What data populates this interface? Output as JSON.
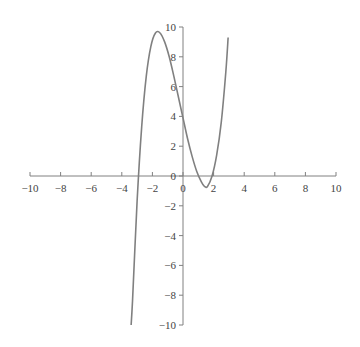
{
  "chart_data": {
    "type": "line",
    "title": "",
    "xlabel": "",
    "ylabel": "",
    "xlim": [
      -10,
      10
    ],
    "ylim": [
      -10,
      10
    ],
    "grid": false,
    "legend": null,
    "x_ticks": [
      -10,
      -8,
      -6,
      -4,
      -2,
      0,
      2,
      4,
      6,
      8,
      10
    ],
    "y_ticks": [
      -10,
      -8,
      -6,
      -4,
      -2,
      0,
      2,
      4,
      6,
      8,
      10
    ],
    "series": [
      {
        "name": "cubic",
        "color": "#808080",
        "x": [
          -3.45,
          -3.3,
          -3.0,
          -2.7,
          -2.4,
          -2.1,
          -1.8,
          -1.5,
          -1.2,
          -0.9,
          -0.6,
          -0.3,
          0.0,
          0.3,
          0.6,
          0.9,
          1.2,
          1.4,
          1.6,
          1.9,
          2.2,
          2.5,
          2.8,
          2.95
        ],
        "y": [
          -10.9,
          -8.4,
          -1.7,
          3.3,
          6.7,
          8.7,
          9.6,
          9.6,
          9.0,
          8.0,
          6.7,
          5.3,
          3.9,
          2.5,
          1.3,
          0.3,
          -0.4,
          -0.7,
          -0.7,
          0.0,
          1.4,
          3.6,
          7.0,
          9.3
        ]
      }
    ],
    "axis_color": "#808080",
    "line_color": "#808080"
  }
}
